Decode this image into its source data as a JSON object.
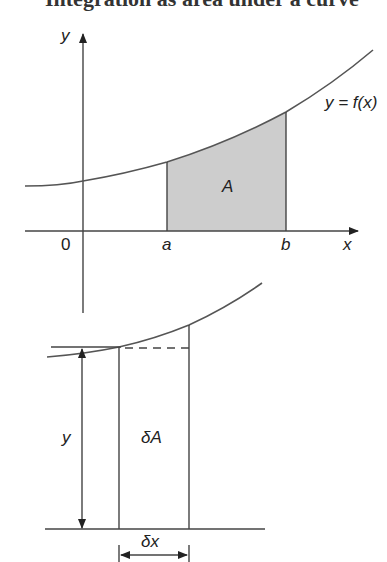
{
  "heading": {
    "text": "Integration as area under a curve"
  },
  "top_figure": {
    "y_axis_label": "y",
    "x_axis_label": "x",
    "origin_label": "0",
    "lower_bound_label": "a",
    "upper_bound_label": "b",
    "area_label": "A",
    "curve_label": "y = f(x)",
    "colors": {
      "shade": "#cdcdcd",
      "line": "#444444",
      "curve": "#555555"
    }
  },
  "bottom_figure": {
    "height_label": "y",
    "strip_area_label": "δA",
    "width_label": "δx"
  }
}
